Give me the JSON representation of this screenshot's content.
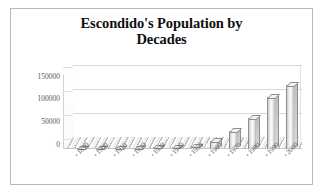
{
  "chart_data": {
    "type": "bar",
    "title": "Escondido's Population by Decades",
    "title_line1": "Escondido's Population by",
    "title_line2": "Decades",
    "xlabel": "",
    "ylabel": "",
    "categories": [
      "1890",
      "1900",
      "1910",
      "1920",
      "1930",
      "1940",
      "1950",
      "1960",
      "1970",
      "1980",
      "1990",
      "2000"
    ],
    "values": [
      755,
      755,
      1334,
      1789,
      3421,
      4560,
      6544,
      16377,
      36792,
      64355,
      108635,
      133559
    ],
    "ylim": [
      0,
      150000
    ],
    "ytick_labels": [
      "0",
      "50000",
      "100000",
      "150000"
    ],
    "ytick_values": [
      0,
      50000,
      100000,
      150000
    ],
    "grid": true,
    "legend": false,
    "style": "3d-column",
    "series": [
      {
        "name": "Population",
        "values": [
          755,
          755,
          1334,
          1789,
          3421,
          4560,
          6544,
          16377,
          36792,
          64355,
          108635,
          133559
        ]
      }
    ],
    "bar_color": "#e0e0e0",
    "gridline_color": "#d9d9d9",
    "text_color": "#585858"
  },
  "axis": {
    "y_ticks": [
      {
        "label": "150000",
        "class": "t150"
      },
      {
        "label": "100000",
        "class": "t100"
      },
      {
        "label": "50000",
        "class": "t50"
      },
      {
        "label": "0",
        "class": "t0"
      }
    ],
    "x_ticks": [
      {
        "marker": "•",
        "label": "1890"
      },
      {
        "marker": "•",
        "label": "1900"
      },
      {
        "marker": "•",
        "label": "1910"
      },
      {
        "marker": "•",
        "label": "1920"
      },
      {
        "marker": "•",
        "label": "1930"
      },
      {
        "marker": "•",
        "label": "1940"
      },
      {
        "marker": "•",
        "label": "1950"
      },
      {
        "marker": "•",
        "label": "1960"
      },
      {
        "marker": "•",
        "label": "1970"
      },
      {
        "marker": "•",
        "label": "1980"
      },
      {
        "marker": "•",
        "label": "1990"
      },
      {
        "marker": "•",
        "label": "2000"
      }
    ]
  }
}
